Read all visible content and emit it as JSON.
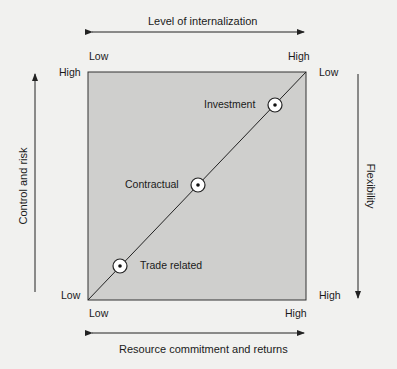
{
  "diagram": {
    "top_axis": {
      "title": "Level of internalization",
      "low": "Low",
      "high": "High"
    },
    "bottom_axis": {
      "title": "Resource commitment and returns",
      "low": "Low",
      "high": "High"
    },
    "left_axis": {
      "title": "Control and risk",
      "high": "High",
      "low": "Low"
    },
    "right_axis": {
      "title": "Flexibility",
      "low": "Low",
      "high": "High"
    },
    "points": [
      {
        "label": "Investment"
      },
      {
        "label": "Contractual"
      },
      {
        "label": "Trade related"
      }
    ],
    "colors": {
      "square_fill": "#cfcfcd",
      "line": "#222222",
      "background": "#f1f1ef"
    }
  }
}
